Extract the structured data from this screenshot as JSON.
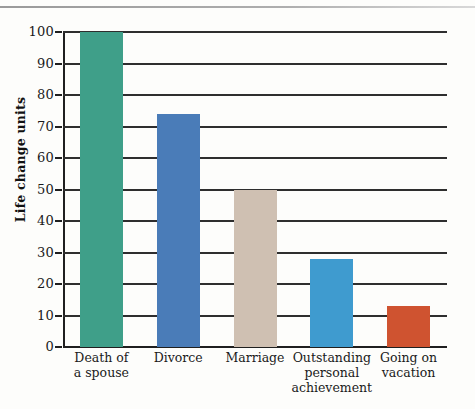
{
  "chart_data": {
    "type": "bar",
    "title": "",
    "xlabel": "",
    "ylabel": "Life change units",
    "ylim": [
      0,
      100
    ],
    "ytick_values": [
      0,
      10,
      20,
      30,
      40,
      50,
      60,
      70,
      80,
      90,
      100
    ],
    "ytick_labels": [
      "0",
      "10",
      "20",
      "30",
      "40",
      "50",
      "60",
      "70",
      "80",
      "90",
      "100"
    ],
    "grid": true,
    "legend": "none",
    "categories": [
      "Death of\na spouse",
      "Divorce",
      "Marriage",
      "Outstanding\npersonal\nachievement",
      "Going on\nvacation"
    ],
    "values": [
      100,
      74,
      50,
      28,
      13
    ],
    "bar_colors": [
      "#3f9f89",
      "#4a7cb8",
      "#cfc0b2",
      "#3f9bcf",
      "#cf5330"
    ],
    "bars": [
      {
        "label_lines": [
          "Death of",
          "a spouse"
        ],
        "value": 100,
        "color": "#3f9f89"
      },
      {
        "label_lines": [
          "Divorce"
        ],
        "value": 74,
        "color": "#4a7cb8"
      },
      {
        "label_lines": [
          "Marriage"
        ],
        "value": 50,
        "color": "#cfc0b2"
      },
      {
        "label_lines": [
          "Outstanding",
          "personal",
          "achievement"
        ],
        "value": 28,
        "color": "#3f9bcf"
      },
      {
        "label_lines": [
          "Going on",
          "vacation"
        ],
        "value": 13,
        "color": "#cf5330"
      }
    ]
  },
  "colors": {
    "axis": "#1f1f1f",
    "gridline": "#2e2e2e",
    "background": "#fdfdfb",
    "text": "#1a1a1a"
  }
}
